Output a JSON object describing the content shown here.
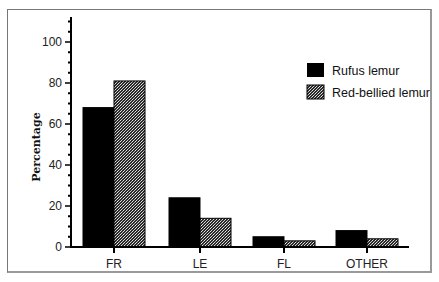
{
  "chart_data": {
    "type": "bar",
    "title": "",
    "xlabel": "",
    "ylabel": "Percentage",
    "ylim": [
      0,
      110
    ],
    "yticks": [
      0,
      20,
      40,
      60,
      80,
      100
    ],
    "categories": [
      "FR",
      "LE",
      "FL",
      "OTHER"
    ],
    "series": [
      {
        "name": "Rufus lemur",
        "fill": "solid-black",
        "color": "#000000",
        "values": [
          68,
          24,
          5,
          8
        ]
      },
      {
        "name": "Red-bellied lemur",
        "fill": "stipple-gray",
        "color": "#8a8a8a",
        "values": [
          81,
          14,
          3,
          4
        ]
      }
    ],
    "grid": false,
    "legend_position": "upper-right"
  },
  "legend": {
    "items": [
      {
        "label": "Rufus lemur"
      },
      {
        "label": "Red-bellied lemur"
      }
    ]
  }
}
